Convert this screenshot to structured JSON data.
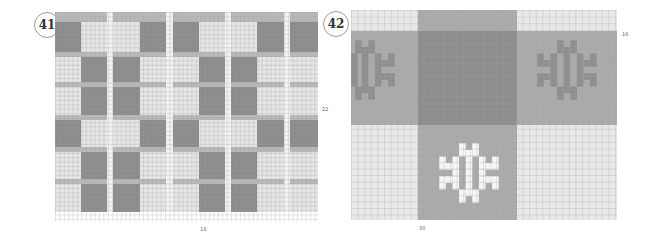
{
  "charts": [
    {
      "id": "41",
      "label": "41",
      "type": "plaid-knitting-chart",
      "width_stitches": "18",
      "height_rows": "22",
      "colors": {
        "dark": "#8c8c8c",
        "mid": "#b9b9b9",
        "light": "#e6e6e6",
        "stripe": "#f2f2f2",
        "grid": "#9f9f9f"
      },
      "col_bands": [
        {
          "w": 26,
          "c": "A"
        },
        {
          "w": 26,
          "c": "B"
        },
        {
          "w": 6,
          "c": "S"
        },
        {
          "w": 27,
          "c": "B"
        },
        {
          "w": 26,
          "c": "A"
        },
        {
          "w": 7,
          "c": "S"
        },
        {
          "w": 26,
          "c": "A"
        },
        {
          "w": 26,
          "c": "B"
        },
        {
          "w": 6,
          "c": "S"
        },
        {
          "w": 26,
          "c": "B"
        },
        {
          "w": 27,
          "c": "A"
        },
        {
          "w": 6,
          "c": "S"
        },
        {
          "w": 28,
          "c": "A"
        }
      ],
      "row_bands": [
        {
          "h": 5,
          "r": "X"
        },
        {
          "h": 5,
          "r": "M"
        },
        {
          "h": 30,
          "r": "P"
        },
        {
          "h": 5,
          "r": "M"
        },
        {
          "h": 25,
          "r": "Q"
        },
        {
          "h": 5,
          "r": "M"
        },
        {
          "h": 28,
          "r": "Q"
        },
        {
          "h": 5,
          "r": "M"
        },
        {
          "h": 27,
          "r": "P"
        },
        {
          "h": 5,
          "r": "M"
        },
        {
          "h": 27,
          "r": "Q"
        },
        {
          "h": 5,
          "r": "M"
        },
        {
          "h": 28,
          "r": "Q"
        }
      ]
    },
    {
      "id": "42",
      "label": "42",
      "type": "snowflake-block-chart",
      "width_stitches": "30",
      "height_rows": "16",
      "colors": {
        "dark": "#8e8e8e",
        "mid": "#ababab",
        "light": "#e8e8e8",
        "white": "#f6f6f6",
        "grid": "#a5a5a5"
      },
      "blocks": [
        {
          "x": 0,
          "y": 0,
          "w": 67,
          "h": 21,
          "c": "light"
        },
        {
          "x": 67,
          "y": 0,
          "w": 99,
          "h": 21,
          "c": "mid"
        },
        {
          "x": 166,
          "y": 0,
          "w": 100,
          "h": 21,
          "c": "light"
        },
        {
          "x": 0,
          "y": 21,
          "w": 67,
          "h": 94,
          "c": "mid"
        },
        {
          "x": 67,
          "y": 21,
          "w": 99,
          "h": 94,
          "c": "dark"
        },
        {
          "x": 166,
          "y": 21,
          "w": 100,
          "h": 94,
          "c": "mid"
        },
        {
          "x": 0,
          "y": 115,
          "w": 67,
          "h": 95,
          "c": "light"
        },
        {
          "x": 67,
          "y": 115,
          "w": 99,
          "h": 95,
          "c": "mid"
        },
        {
          "x": 166,
          "y": 115,
          "w": 100,
          "h": 95,
          "c": "light"
        }
      ],
      "motifs": [
        {
          "name": "snowflake-left",
          "cx": 14,
          "cy": 60,
          "color": "dark"
        },
        {
          "name": "snowflake-right",
          "cx": 216,
          "cy": 60,
          "color": "dark"
        },
        {
          "name": "snowflake-bottom",
          "cx": 118,
          "cy": 163,
          "color": "white"
        }
      ]
    }
  ]
}
